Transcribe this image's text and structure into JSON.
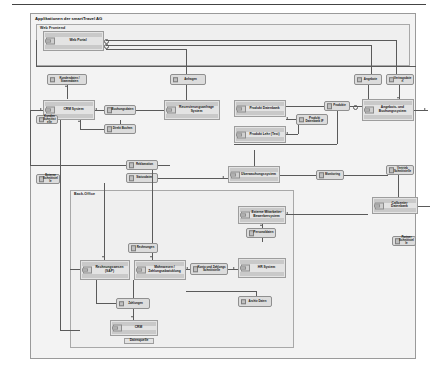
{
  "diagram": {
    "title": "Applikationen der smartTravel AG",
    "type": "uml-component-diagram"
  },
  "packages": [
    {
      "id": "web_frontend",
      "label": "Web Frontend"
    },
    {
      "id": "back_office",
      "label": "Back-Office"
    }
  ],
  "components": [
    {
      "id": "web_portal",
      "label": "Web Portal"
    },
    {
      "id": "crm_system",
      "label": "CRM System"
    },
    {
      "id": "reservierung",
      "label": "Reservierungsanfrage System"
    },
    {
      "id": "produkt_db",
      "label": "Produkt Datenbank"
    },
    {
      "id": "produkt_lehr",
      "label": "Produkt Lehr (Test)"
    },
    {
      "id": "angebot_buchung",
      "label": "Angebots- und Buchungssystem"
    },
    {
      "id": "ueberwachung",
      "label": "Überwachungssystem"
    },
    {
      "id": "rechnungswesen",
      "label": "Rechnungswesen (SAP)"
    },
    {
      "id": "mahnwesen",
      "label": "Mahnwesen / Zahlungsabwicklung"
    },
    {
      "id": "hr_system",
      "label": "HR System"
    },
    {
      "id": "crm_archiv",
      "label": "CRM"
    },
    {
      "id": "callcenter",
      "label": "Callcenter Datenbank"
    }
  ],
  "interfaces": [
    {
      "id": "kundendaten",
      "label": "Kundendaten / Stammdaten"
    },
    {
      "id": "anfragen",
      "label": "Anfragen"
    },
    {
      "id": "buchungsdaten",
      "label": "Buchungsdaten"
    },
    {
      "id": "direktbuchung",
      "label": "Direkt Buchen"
    },
    {
      "id": "produkte",
      "label": "Produkte"
    },
    {
      "id": "produkt_if",
      "label": "Produkt Datenbank IF"
    },
    {
      "id": "angebote",
      "label": "Angebote"
    },
    {
      "id": "vertragsdaten",
      "label": "Vertragsdaten"
    },
    {
      "id": "rechnungen",
      "label": "Rechnungen"
    },
    {
      "id": "reklamation",
      "label": "Reklamation"
    },
    {
      "id": "monitoring",
      "label": "Monitoring"
    },
    {
      "id": "statusdaten",
      "label": "Statusdaten"
    },
    {
      "id": "zahlungen",
      "label": "Zahlungen"
    },
    {
      "id": "konto_if",
      "label": "Konto und Zahlungs Schnittstelle"
    },
    {
      "id": "personaldaten",
      "label": "Personaldaten"
    },
    {
      "id": "lohndaten",
      "label": "Lohndaten / Lohnabrechnung"
    },
    {
      "id": "archivdaten",
      "label": "Archiv Daten"
    },
    {
      "id": "kunden_if",
      "label": "Kunden Schnittstelle"
    },
    {
      "id": "extern_if",
      "label": "Externe Schnittstelle"
    },
    {
      "id": "partner_if",
      "label": "Partner Schnittstelle"
    },
    {
      "id": "vertrieb_if",
      "label": "Vertrieb Schnittstelle"
    }
  ],
  "extra_nodes": [
    {
      "id": "ext_mitarbeiter",
      "label": "Externe Mitarbeiter Bewerbersystem"
    },
    {
      "id": "datenquelle",
      "label": "Datenquelle"
    }
  ],
  "colors": {
    "node_fill": "#e3e3e3",
    "node_band": "#c9c9c9",
    "node_border": "#9d9d9d",
    "package_fill": "#efefef",
    "frame_fill": "#f3f3f3",
    "connector": "#5a5a5a"
  }
}
